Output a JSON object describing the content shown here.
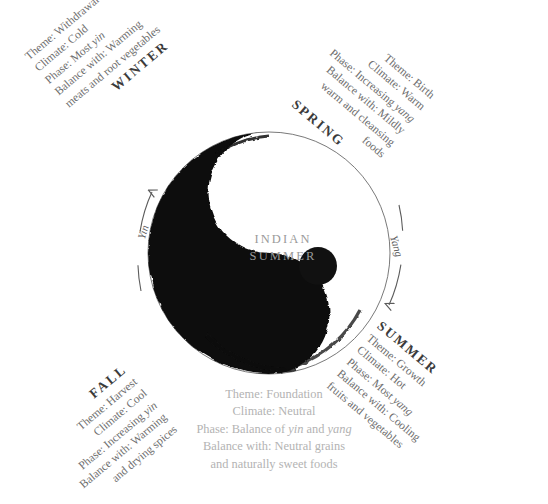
{
  "diagram": {
    "center_label": {
      "line1": "INDIAN",
      "line2": "SUMMER"
    },
    "flow": {
      "yin_label": "Yin",
      "yang_label": "Yang",
      "yin_arrow_icon": "curved-arrow-up-icon",
      "yang_arrow_icon": "curved-arrow-down-icon"
    },
    "symbol": {
      "name": "yin-yang-icon",
      "dark_color": "#111111",
      "light_color": "#ffffff",
      "outline_color": "#5a5a5a"
    },
    "seasons": [
      {
        "id": "winter",
        "name": "WINTER",
        "lines": [
          "Theme: Withdrawal",
          "Climate: Cold",
          "Phase: Most yin",
          "Balance with: Warming",
          "meats and root vegetables"
        ],
        "phase_plain_prefix": "Phase: Most ",
        "phase_italic": "yin"
      },
      {
        "id": "spring",
        "name": "SPRING",
        "lines": [
          "Theme: Birth",
          "Climate: Warm",
          "Phase: Increasing yang",
          "Balance with: Mildly",
          "warm and cleansing",
          "foods"
        ],
        "phase_plain_prefix": "Phase: Increasing ",
        "phase_italic": "yang"
      },
      {
        "id": "summer",
        "name": "SUMMER",
        "lines": [
          "Theme: Growth",
          "Climate: Hot",
          "Phase: Most yang",
          "Balance with: Cooling",
          "fruits and vegetables"
        ],
        "phase_plain_prefix": "Phase: Most ",
        "phase_italic": "yang"
      },
      {
        "id": "fall",
        "name": "FALL",
        "lines": [
          "Theme: Harvest",
          "Climate: Cool",
          "Phase: Increasing yin",
          "Balance with: Warming",
          "and drying spices"
        ],
        "phase_plain_prefix": "Phase: Increasing ",
        "phase_italic": "yin"
      }
    ],
    "indian_summer": {
      "line1": "Theme: Foundation",
      "line2": "Climate: Neutral",
      "line3_a": "Phase: Balance of ",
      "line3_yin": "yin",
      "line3_b": " and ",
      "line3_yang": "yang",
      "line4": "Balance with: Neutral grains",
      "line5": "and naturally sweet foods"
    }
  }
}
